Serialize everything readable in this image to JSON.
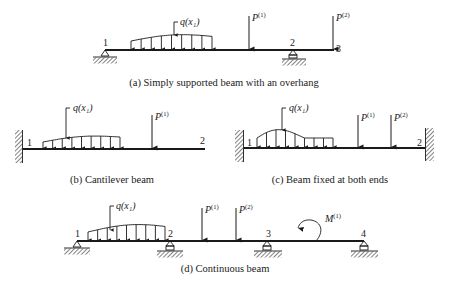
{
  "figures": [
    {
      "id": "a",
      "caption": "(a) Simply supported beam with an overhang",
      "nodes": [
        "1",
        "2",
        "3"
      ],
      "loads": {
        "distributed": "q(x₁)",
        "point": [
          {
            "base": "P",
            "sup": "(1)"
          },
          {
            "base": "P",
            "sup": "(2)"
          }
        ]
      },
      "supports": [
        "pin",
        "roller",
        "free"
      ]
    },
    {
      "id": "b",
      "caption": "(b) Cantilever beam",
      "nodes": [
        "1",
        "2"
      ],
      "loads": {
        "distributed": "q(x₁)",
        "point": [
          {
            "base": "P",
            "sup": "(1)"
          }
        ]
      },
      "supports": [
        "fixed",
        "free"
      ]
    },
    {
      "id": "c",
      "caption": "(c) Beam fixed at both ends",
      "nodes": [
        "1",
        "2"
      ],
      "loads": {
        "distributed": "q(x₁)",
        "point": [
          {
            "base": "P",
            "sup": "(1)"
          },
          {
            "base": "P",
            "sup": "(2)"
          }
        ]
      },
      "supports": [
        "fixed",
        "fixed"
      ]
    },
    {
      "id": "d",
      "caption": "(d) Continuous beam",
      "nodes": [
        "1",
        "2",
        "3",
        "4"
      ],
      "loads": {
        "distributed": "q(x₁)",
        "point": [
          {
            "base": "P",
            "sup": "(1)"
          },
          {
            "base": "P",
            "sup": "(2)"
          }
        ],
        "moment": {
          "base": "M",
          "sup": "(1)"
        }
      },
      "supports": [
        "pin",
        "roller",
        "roller",
        "roller"
      ]
    }
  ]
}
